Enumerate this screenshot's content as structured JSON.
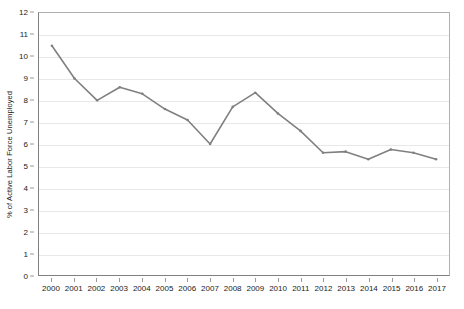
{
  "chart_data": {
    "type": "line",
    "title": "",
    "xlabel": "",
    "ylabel": "% of Active Labor Force Unemployed",
    "categories": [
      "2000",
      "2001",
      "2002",
      "2003",
      "2004",
      "2005",
      "2006",
      "2007",
      "2008",
      "2009",
      "2010",
      "2011",
      "2012",
      "2013",
      "2014",
      "2015",
      "2016",
      "2017"
    ],
    "values": [
      10.5,
      9.0,
      8.0,
      8.6,
      8.3,
      7.6,
      7.1,
      6.0,
      7.7,
      8.35,
      7.4,
      6.6,
      5.6,
      5.65,
      5.3,
      5.75,
      5.6,
      5.3
    ],
    "series": [
      {
        "name": "% of Active Labor Force Unemployed",
        "values": [
          10.5,
          9.0,
          8.0,
          8.6,
          8.3,
          7.6,
          7.1,
          6.0,
          7.7,
          8.35,
          7.4,
          6.6,
          5.6,
          5.65,
          5.3,
          5.75,
          5.6,
          5.3
        ]
      }
    ],
    "ylim": [
      0,
      12
    ],
    "ytick_step": 1,
    "yticks": [
      "0",
      "1",
      "2",
      "3",
      "4",
      "5",
      "6",
      "7",
      "8",
      "9",
      "10",
      "11",
      "12"
    ],
    "grid": true,
    "grid_axis": "y",
    "legend": false,
    "legend_position": "none",
    "line_color": "#808080",
    "marker": "dot",
    "marker_color": "#808080",
    "gridline_color": "#e8e8e8",
    "axis_color": "#808080",
    "background_color": "#ffffff",
    "text_color": "#1a1a1a"
  }
}
